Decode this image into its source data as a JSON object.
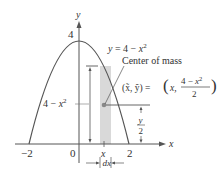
{
  "figure": {
    "type": "center-of-mass-parabola",
    "curve_label": "y = 4 − x²",
    "curve_label_parts": {
      "lhs": "y",
      "eq": " = 4 − ",
      "var": "x",
      "exp": "2"
    },
    "center_of_mass_label": "Center of mass",
    "centroid_formula": {
      "lhs": "(x̃, ỹ) = ",
      "x_part": "x,",
      "numerator": "4 − x²",
      "numerator_parts": {
        "const": "4 − ",
        "var": "x",
        "exp": "2"
      },
      "denominator": "2"
    },
    "height_label": {
      "const": "4 − ",
      "var": "x",
      "exp": "2"
    },
    "half_height_label": {
      "num": "y",
      "den": "2"
    },
    "strip_x_label": "x",
    "width_label": "dx",
    "axes": {
      "x_label": "x",
      "y_label": "y",
      "x_ticks": [
        "−2",
        "0",
        "2"
      ],
      "y_ticks": [
        "4"
      ]
    },
    "colors": {
      "curve": "#555555",
      "axis": "#555555",
      "strip_fill": "#d9d9d9",
      "text": "#333333",
      "dot": "#888888"
    }
  }
}
